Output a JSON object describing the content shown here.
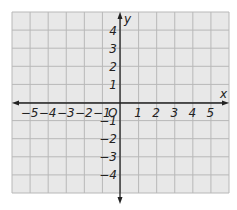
{
  "diagram": {
    "type": "coordinate-plane",
    "x_axis": {
      "label": "x",
      "min": -6,
      "max": 6,
      "tick_labels": [
        "−5",
        "−4",
        "−3",
        "−2",
        "−1",
        "1",
        "2",
        "3",
        "4",
        "5"
      ],
      "tick_values": [
        -5,
        -4,
        -3,
        -2,
        -1,
        1,
        2,
        3,
        4,
        5
      ]
    },
    "y_axis": {
      "label": "y",
      "min": -5,
      "max": 5,
      "tick_labels": [
        "4",
        "3",
        "2",
        "1",
        "−1",
        "−2",
        "−3",
        "−4"
      ],
      "tick_values": [
        4,
        3,
        2,
        1,
        -1,
        -2,
        -3,
        -4
      ]
    },
    "origin_label": "O",
    "grid": {
      "columns": 12,
      "rows": 10,
      "background": "#e8e8e8",
      "line_color": "#b8b8b8",
      "axis_color": "#222222"
    }
  }
}
